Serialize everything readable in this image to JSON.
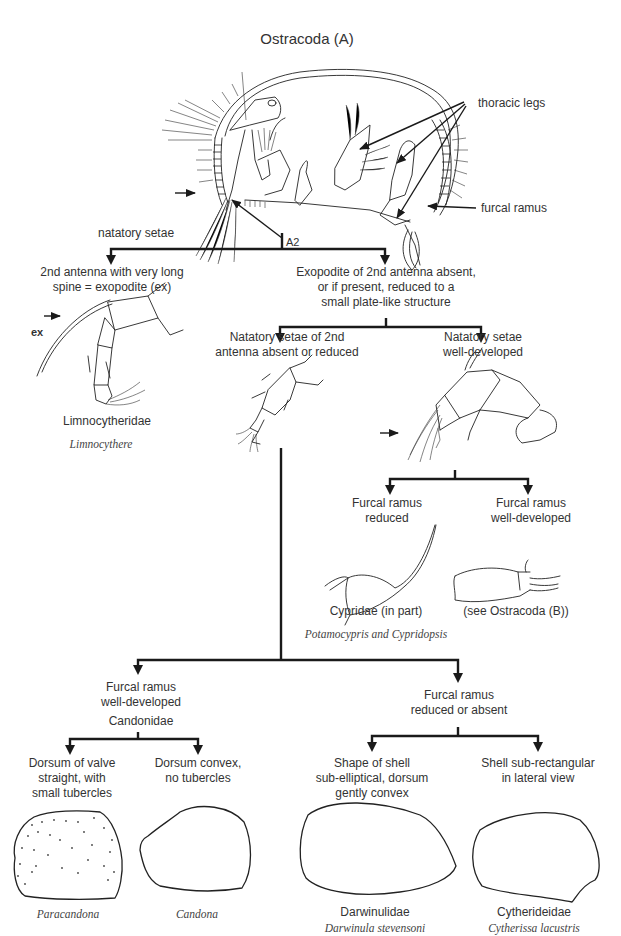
{
  "title": "Ostracoda (A)",
  "main_figure": {
    "labels": {
      "thoracic_legs": "thoracic legs",
      "furcal_ramus": "furcal ramus",
      "natatory_setae": "natatory setae",
      "a2": "A2"
    }
  },
  "key": {
    "level1": {
      "left": {
        "line1": "2nd antenna with very long",
        "line2": "spine = exopodite (ex)"
      },
      "right": {
        "line1": "Exopodite of 2nd antenna absent,",
        "line2": "or if present, reduced to a",
        "line3": "small plate-like structure"
      }
    },
    "limno": {
      "ex_label": "ex",
      "family": "Limnocytheridae",
      "genus": "Limnocythere"
    },
    "level2": {
      "left": {
        "line1": "Natatory setae of 2nd",
        "line2": "antenna absent or reduced"
      },
      "right": {
        "line1": "Natatory setae",
        "line2": "well-developed"
      }
    },
    "level3": {
      "left": {
        "line1": "Furcal ramus",
        "line2": "reduced",
        "family": "Cypridae (in part)",
        "genus": "Potamocypris and Cypridopsis"
      },
      "right": {
        "line1": "Furcal ramus",
        "line2": "well-developed",
        "note": "(see Ostracoda (B))"
      }
    },
    "level4": {
      "left": {
        "line1": "Furcal ramus",
        "line2": "well-developed",
        "family": "Candonidae"
      },
      "right": {
        "line1": "Furcal ramus",
        "line2": "reduced or absent"
      }
    },
    "level5": {
      "a": {
        "line1": "Dorsum of valve",
        "line2": "straight, with",
        "line3": "small tubercles",
        "genus": "Paracandona"
      },
      "b": {
        "line1": "Dorsum convex,",
        "line2": "no tubercles",
        "genus": "Candona"
      },
      "c": {
        "line1": "Shape of shell",
        "line2": "sub-elliptical, dorsum",
        "line3": "gently convex",
        "family": "Darwinulidae",
        "genus": "Darwinula stevensoni"
      },
      "d": {
        "line1": "Shell sub-rectangular",
        "line2": "in lateral view",
        "family": "Cytherideidae",
        "genus": "Cytherissa lacustris"
      }
    }
  }
}
